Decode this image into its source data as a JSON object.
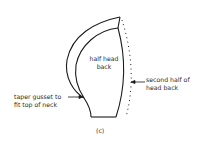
{
  "diagram": {
    "center_label": [
      "half head",
      "back"
    ],
    "right_label": [
      "second half of",
      "head back"
    ],
    "left_label": [
      "taper gusset to",
      "fit top of neck"
    ],
    "caption": "(c)",
    "line_color": "#1a1a1a"
  }
}
